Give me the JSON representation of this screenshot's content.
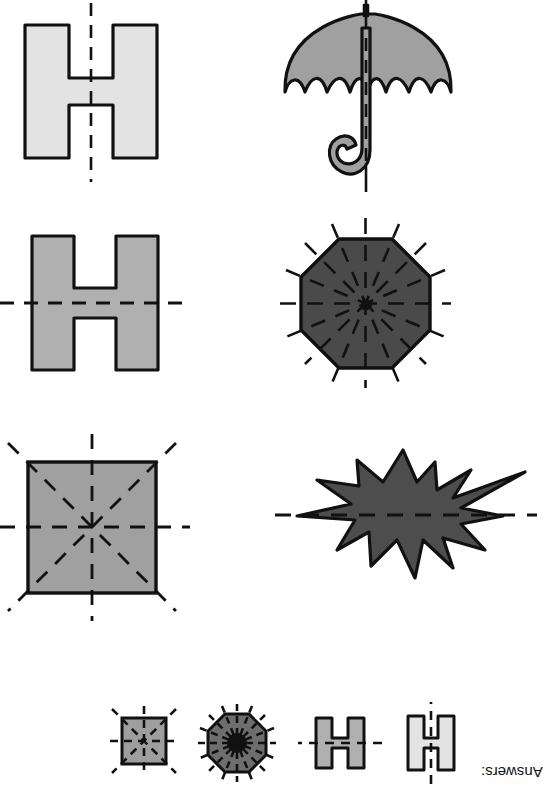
{
  "worksheet": {
    "title": "Lines of Symmetry Worksheet",
    "background": "#ffffff"
  },
  "palette": {
    "outline": "#111111",
    "dash": "#111111",
    "fill_very_light_gray": "#e3e3e3",
    "fill_light_gray": "#b0b0b0",
    "fill_medium_gray": "#a0a0a0",
    "fill_dark_gray": "#4a4a4a",
    "fill_star_gray": "#4d4d4d",
    "fill_mini_square": "#9e9e9e",
    "fill_mini_octagon": "#6e6e6e",
    "fill_mini_h_gray": "#b0b0b0",
    "fill_mini_h_light": "#e3e3e3"
  },
  "problems": [
    {
      "index": 1,
      "shape": "letter-h",
      "shape_label": "Letter H",
      "fill": "#e3e3e3",
      "symmetry_lines": 1,
      "symmetry_axis": "vertical",
      "row": 1,
      "column": 1
    },
    {
      "index": 2,
      "shape": "umbrella",
      "shape_label": "Umbrella",
      "fill": "#a0a0a0",
      "symmetry_lines": 1,
      "symmetry_axis": "vertical",
      "row": 1,
      "column": 2
    },
    {
      "index": 3,
      "shape": "letter-h",
      "shape_label": "Letter H",
      "fill": "#b0b0b0",
      "symmetry_lines": 1,
      "symmetry_axis": "horizontal",
      "row": 2,
      "column": 1
    },
    {
      "index": 4,
      "shape": "octagon",
      "shape_label": "Octagon",
      "fill": "#4a4a4a",
      "symmetry_lines": 8,
      "symmetry_axis": "radial",
      "row": 2,
      "column": 2
    },
    {
      "index": 5,
      "shape": "square",
      "shape_label": "Square",
      "fill": "#a0a0a0",
      "symmetry_lines": 4,
      "symmetry_axis": "vertical-horizontal-diagonal",
      "row": 3,
      "column": 1
    },
    {
      "index": 6,
      "shape": "star-burst",
      "shape_label": "Star burst",
      "fill": "#4d4d4d",
      "symmetry_lines": 1,
      "symmetry_axis": "horizontal",
      "row": 3,
      "column": 2
    }
  ],
  "answers": {
    "label": "Answers:",
    "rotated": "180deg",
    "items": [
      {
        "order": 1,
        "shape": "square",
        "shape_label": "Square",
        "fill": "#9e9e9e",
        "symmetry_lines": 4
      },
      {
        "order": 2,
        "shape": "octagon",
        "shape_label": "Octagon",
        "fill": "#6e6e6e",
        "symmetry_lines": 8
      },
      {
        "order": 3,
        "shape": "letter-h",
        "shape_label": "Letter H",
        "fill": "#b0b0b0",
        "symmetry_lines": 1
      },
      {
        "order": 4,
        "shape": "letter-h",
        "shape_label": "Letter H",
        "fill": "#e3e3e3",
        "symmetry_lines": 1
      }
    ]
  }
}
